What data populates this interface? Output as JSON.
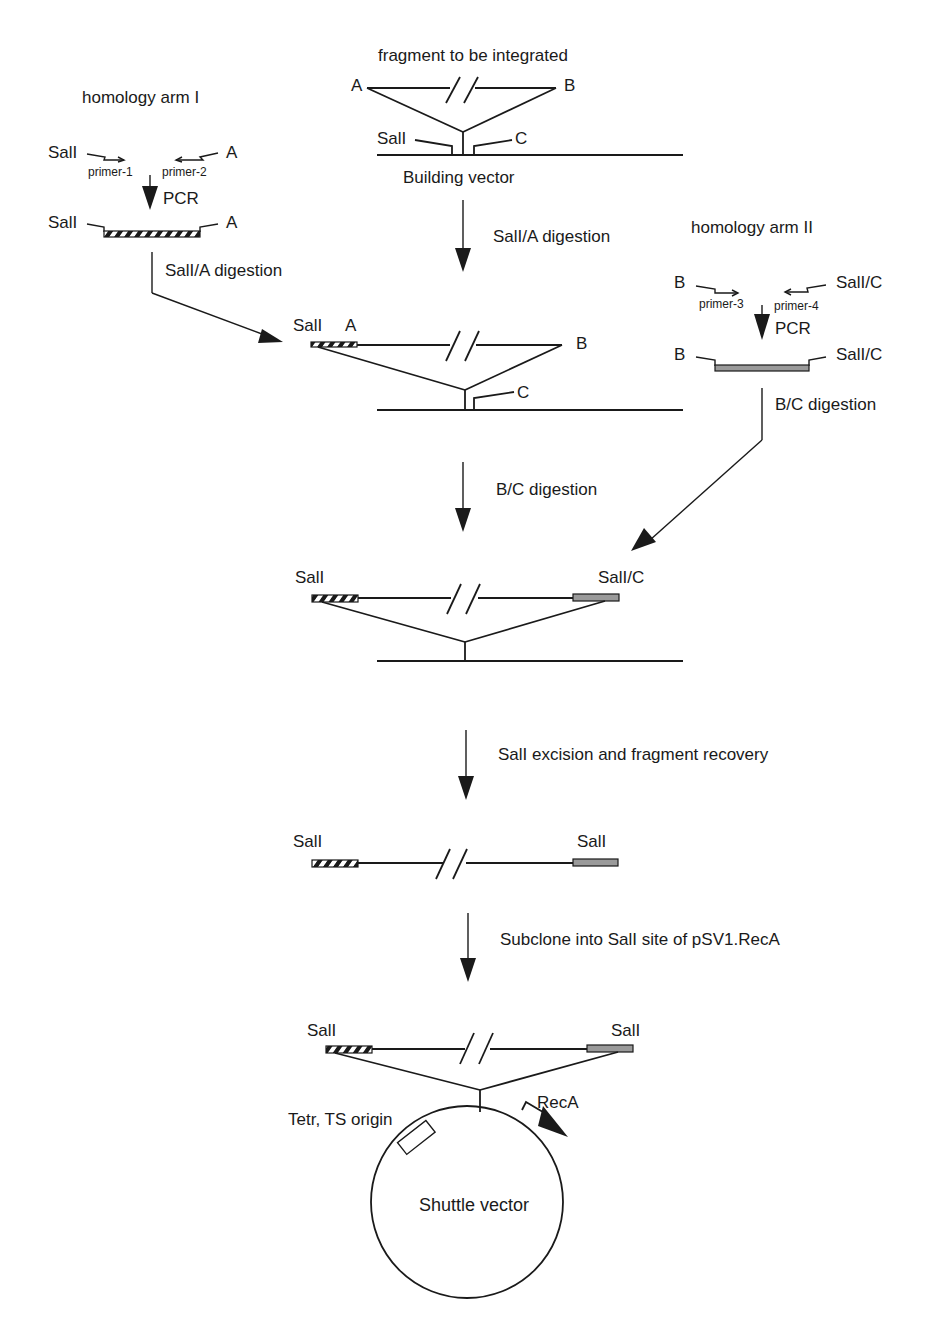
{
  "top": {
    "fragment_label": "fragment to be integrated",
    "site_a": "A",
    "site_b": "B",
    "site_sall": "SalI",
    "site_c": "C",
    "vector_label": "Building vector"
  },
  "arm1": {
    "title": "homology arm I",
    "left_site": "SalI",
    "right_site": "A",
    "primer_left": "primer-1",
    "primer_right": "primer-2",
    "pcr_label": "PCR",
    "product_left": "SalI",
    "product_right": "A",
    "digestion_label": "SalI/A digestion"
  },
  "arm2": {
    "title": "homology arm II",
    "left_site": "B",
    "right_site": "SalI/C",
    "primer_left": "primer-3",
    "primer_right": "primer-4",
    "pcr_label": "PCR",
    "product_left": "B",
    "product_right": "SalI/C",
    "digestion_label": "B/C digestion"
  },
  "steps": [
    {
      "label": "SalI/A digestion"
    },
    {
      "label": "B/C digestion"
    },
    {
      "label": "SalI excision and fragment recovery"
    },
    {
      "label": "Subclone into SalI site of pSV1.RecA"
    }
  ],
  "stage2": {
    "left": "SalI",
    "left2": "A",
    "right": "B",
    "site_c": "C"
  },
  "stage3": {
    "left": "SalI",
    "right": "SalI/C"
  },
  "stage4": {
    "left": "SalI",
    "right": "SalI"
  },
  "stage5": {
    "left": "SalI",
    "right": "SalI",
    "tet_label": "Tetr, TS origin",
    "reca_label": "RecA",
    "circle_label": "Shuttle vector"
  }
}
